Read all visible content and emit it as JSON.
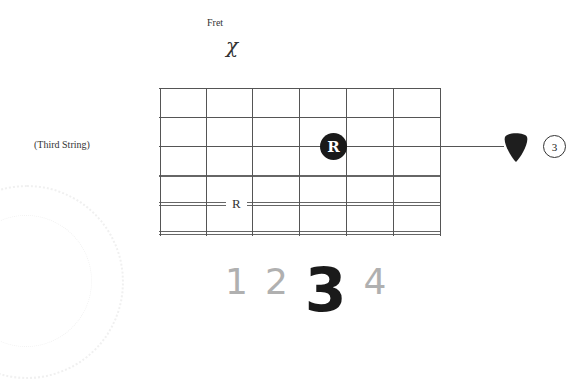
{
  "header": {
    "fret_label": "Fret",
    "fret_value": "χ"
  },
  "fretboard": {
    "string_label": "(Third String)",
    "strings": 6,
    "frets": 6,
    "root_fretted": {
      "label": "R",
      "string": 3,
      "fret": 4
    },
    "root_open": {
      "label": "R",
      "string": 5
    },
    "string_number": "3",
    "pick_icon": "guitar-pick-icon"
  },
  "fingers": {
    "items": [
      {
        "label": "1",
        "active": false
      },
      {
        "label": "2",
        "active": false
      },
      {
        "label": "3",
        "active": true
      },
      {
        "label": "4",
        "active": false
      }
    ],
    "active_color": "#1a1a1a",
    "inactive_color": "#b0b0b0"
  }
}
